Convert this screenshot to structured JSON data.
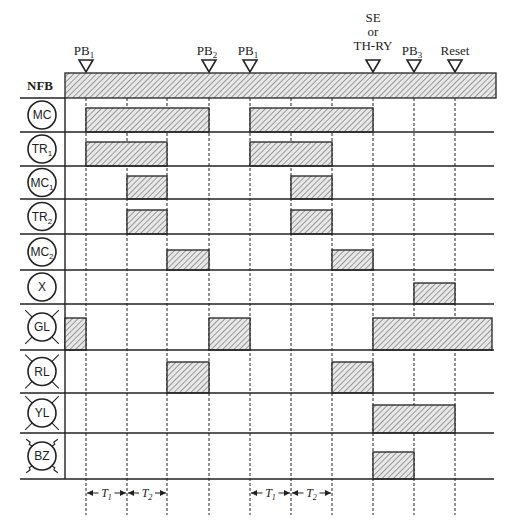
{
  "chart_data": {
    "type": "timing-diagram",
    "title": "",
    "time_markers": [
      {
        "label": "PB1",
        "base": "PB",
        "sub": "1",
        "x": 86
      },
      {
        "label": "PB2",
        "base": "PB",
        "sub": "2",
        "x": 209
      },
      {
        "label": "PB1",
        "base": "PB",
        "sub": "1",
        "x": 250
      },
      {
        "label": "SE or TH-RY",
        "lines": [
          "SE",
          "or",
          "TH-RY"
        ],
        "x": 373
      },
      {
        "label": "PB3",
        "base": "PB",
        "sub": "3",
        "x": 414
      },
      {
        "label": "Reset",
        "x": 455
      }
    ],
    "grid_x": [
      86,
      127,
      167,
      209,
      250,
      291,
      332,
      373,
      414,
      455
    ],
    "rows": [
      {
        "name": "NFB",
        "symbol": "text",
        "on": [
          [
            65,
            496
          ]
        ]
      },
      {
        "name": "MC",
        "symbol": "coil",
        "on": [
          [
            86,
            209
          ],
          [
            250,
            373
          ]
        ]
      },
      {
        "name": "TR1",
        "base": "TR",
        "sub": "1",
        "symbol": "coil",
        "on": [
          [
            86,
            167
          ],
          [
            250,
            332
          ]
        ]
      },
      {
        "name": "MC1",
        "base": "MC",
        "sub": "1",
        "symbol": "coil",
        "on": [
          [
            127,
            167
          ],
          [
            291,
            332
          ]
        ]
      },
      {
        "name": "TR2",
        "base": "TR",
        "sub": "2",
        "symbol": "coil",
        "on": [
          [
            127,
            167
          ],
          [
            291,
            332
          ]
        ]
      },
      {
        "name": "MC2",
        "base": "MC",
        "sub": "2",
        "symbol": "coil",
        "on": [
          [
            167,
            209
          ],
          [
            332,
            373
          ]
        ]
      },
      {
        "name": "X",
        "symbol": "coil",
        "on": [
          [
            414,
            455
          ]
        ]
      },
      {
        "name": "GL",
        "symbol": "lamp",
        "on": [
          [
            65,
            86
          ],
          [
            209,
            250
          ],
          [
            373,
            492
          ]
        ]
      },
      {
        "name": "RL",
        "symbol": "lamp",
        "on": [
          [
            167,
            209
          ],
          [
            332,
            373
          ]
        ]
      },
      {
        "name": "YL",
        "symbol": "lamp",
        "on": [
          [
            373,
            455
          ]
        ]
      },
      {
        "name": "BZ",
        "symbol": "buzzer",
        "on": [
          [
            373,
            414
          ]
        ]
      }
    ],
    "intervals": [
      {
        "label": "T1",
        "from": 86,
        "to": 127
      },
      {
        "label": "T2",
        "from": 127,
        "to": 167
      },
      {
        "label": "T1",
        "from": 250,
        "to": 291
      },
      {
        "label": "T2",
        "from": 291,
        "to": 332
      }
    ]
  },
  "colors": {
    "line": "#222222",
    "hatch": "#444444",
    "fill": "#e6e6e6"
  }
}
